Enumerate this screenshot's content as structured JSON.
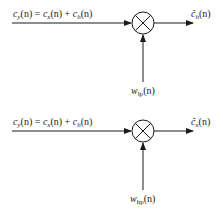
{
  "diagrams": [
    {
      "name": "low-pass liftering",
      "input_label": {
        "c": "c",
        "y": "y",
        "eq": "(n) = ",
        "x": "x",
        "plus": "(n) + ",
        "h": "h",
        "tail": "(n)"
      },
      "output_label": {
        "hat": "ĉ",
        "sub": "h",
        "tail": "(n)"
      },
      "window_label": {
        "w": "w",
        "sub": "lp",
        "tail": "(n)"
      },
      "operator": "multiply"
    },
    {
      "name": "high-pass liftering",
      "input_label": {
        "c": "c",
        "y": "y",
        "eq": "(n) = ",
        "x": "x",
        "plus": "(n) + ",
        "h": "h",
        "tail": "(n)"
      },
      "output_label": {
        "hat": "ĉ",
        "sub": "x",
        "tail": "(n)"
      },
      "window_label": {
        "w": "w",
        "sub": "hp",
        "tail": "(n)"
      },
      "operator": "multiply"
    }
  ],
  "colors": {
    "stroke": "#1a1a1a",
    "background": "#ffffff"
  }
}
